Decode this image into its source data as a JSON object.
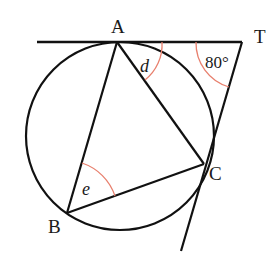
{
  "figure": {
    "colors": {
      "line": "#111111",
      "angle_arc": "#e8806e",
      "background": "#ffffff"
    },
    "points": {
      "A": "A",
      "B": "B",
      "C": "C",
      "T": "T"
    },
    "angles": {
      "d": "d",
      "e": "e",
      "T_angle": "80°"
    }
  }
}
